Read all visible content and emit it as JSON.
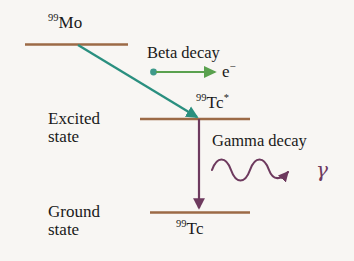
{
  "figure": {
    "background_color": "#f8f6f3"
  },
  "colors": {
    "level_line": "#9c6a46",
    "beta_arrow_teal": "#2a8f7f",
    "beta_arrow_green": "#5aa14e",
    "gamma_purple": "#6e3a5e",
    "text": "#1a1a1a"
  },
  "levels": [
    {
      "id": "mo99",
      "nuclide_mass": "99",
      "nuclide_symbol": "Mo",
      "state_label_line1": "",
      "state_label_line2": ""
    },
    {
      "id": "tc99m",
      "nuclide_mass": "99",
      "nuclide_symbol": "Tc",
      "nuclide_excited_marker": "*",
      "state_label_line1": "Excited",
      "state_label_line2": "state"
    },
    {
      "id": "tc99",
      "nuclide_mass": "99",
      "nuclide_symbol": "Tc",
      "state_label_line1": "Ground",
      "state_label_line2": "state"
    }
  ],
  "transitions": {
    "beta": {
      "label": "Beta decay",
      "particle_symbol": "e",
      "particle_charge": "−"
    },
    "gamma": {
      "label": "Gamma decay",
      "particle_symbol": "γ"
    }
  }
}
